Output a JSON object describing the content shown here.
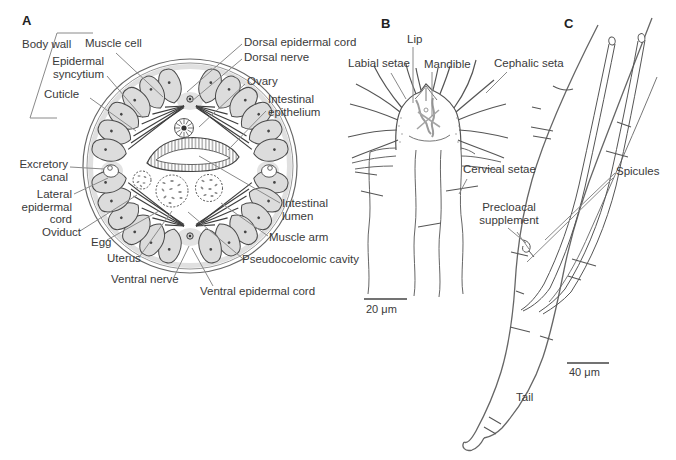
{
  "palette": {
    "background": "#ffffff",
    "drawing_line": "#5f5f5f",
    "leader_line": "#8a8a8a",
    "text": "#3a3a3a",
    "muscle_fill": "#dcdcdc",
    "mandible_gray": "#9b9b9b"
  },
  "panelA": {
    "letter": "A",
    "labels": {
      "body_wall": "Body wall",
      "muscle_cell": "Muscle cell",
      "epidermal_syncytium": "Epidermal syncytium",
      "cuticle": "Cuticle",
      "dorsal_epidermal_cord": "Dorsal epidermal cord",
      "dorsal_nerve": "Dorsal nerve",
      "ovary": "Ovary",
      "intestinal_epithelium": "Intestinal epithelium",
      "excretory_canal": "Excretory canal",
      "lateral_epidermal_cord": "Lateral epidermal cord",
      "oviduct": "Oviduct",
      "egg": "Egg",
      "uterus": "Uterus",
      "ventral_nerve": "Ventral nerve",
      "ventral_epidermal_cord": "Ventral epidermal cord",
      "pseudocoelomic_cavity": "Pseudocoelomic cavity",
      "muscle_arm": "Muscle arm",
      "intestinal_lumen": "Intestinal lumen"
    }
  },
  "panelB": {
    "letter": "B",
    "labels": {
      "lip": "Lip",
      "labial_setae": "Labial setae",
      "mandible": "Mandible",
      "cephalic_seta": "Cephalic seta",
      "cervical_setae": "Cervical setae"
    },
    "scale_bar": "20 μm"
  },
  "panelC": {
    "letter": "C",
    "labels": {
      "precloacal_supplement": "Precloacal supplement",
      "spicules": "Spicules",
      "tail": "Tail"
    },
    "scale_bar": "40 μm"
  }
}
